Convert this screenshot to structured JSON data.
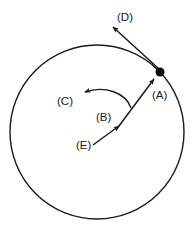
{
  "figure": {
    "type": "physics-diagram",
    "background_color": "#fefefe",
    "ink_color": "#1a1a1a",
    "canvas": {
      "width": 196,
      "height": 236
    }
  },
  "circle": {
    "name": "circular-path",
    "center_x": 97,
    "center_y": 132,
    "radius": 87,
    "stroke_width": 1.4,
    "filled": false
  },
  "particle": {
    "name": "particle-dot",
    "x": 160,
    "y": 72,
    "radius": 4.5,
    "color": "#0d0d0d"
  },
  "labels": [
    {
      "id": "A",
      "text": "(A)",
      "x": 152,
      "y": 99
    },
    {
      "id": "B",
      "text": "(B)",
      "x": 96,
      "y": 121
    },
    {
      "id": "C",
      "text": "(C)",
      "x": 57,
      "y": 105
    },
    {
      "id": "D",
      "text": "(D)",
      "x": 117,
      "y": 21
    },
    {
      "id": "E",
      "text": "(E)",
      "x": 76,
      "y": 149
    }
  ],
  "arrows": [
    {
      "id": "D",
      "name": "tangential-arrow-d",
      "description": "Straight arrow from particle pointing up-left, outward tangent",
      "from_x": 159,
      "from_y": 69,
      "to_x": 111,
      "to_y": 25,
      "arrowhead": "at-tip"
    },
    {
      "id": "A",
      "name": "radial-arrow-a",
      "description": "Arrow along the radius pointing up-right toward the particle",
      "from_x": 118,
      "from_y": 128,
      "to_x": 155,
      "to_y": 78,
      "arrowhead": "at-tip"
    },
    {
      "id": "E",
      "name": "radial-arrow-e",
      "description": "Arrow from inner point pointing up-right along the radius",
      "from_x": 95,
      "from_y": 143,
      "to_x": 120,
      "to_y": 125,
      "arrowhead": "at-tip"
    },
    {
      "id": "C",
      "name": "curved-arrow-c",
      "description": "Curved arc arrow sweeping from lower-right to the left",
      "from_x": 130,
      "from_y": 107,
      "to_x": 82,
      "to_y": 93,
      "arrowhead": "at-tip",
      "curved": true
    }
  ]
}
